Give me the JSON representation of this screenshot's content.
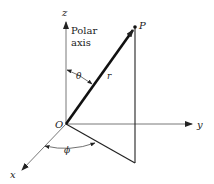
{
  "diagram": {
    "labels": {
      "z_axis": "z",
      "y_axis": "y",
      "x_axis": "x",
      "origin": "O",
      "point": "P",
      "radius": "r",
      "theta": "θ",
      "phi": "ϕ",
      "polar_axis_line1": "Polar",
      "polar_axis_line2": "axis"
    },
    "colors": {
      "line": "#222222",
      "background": "#ffffff"
    }
  }
}
